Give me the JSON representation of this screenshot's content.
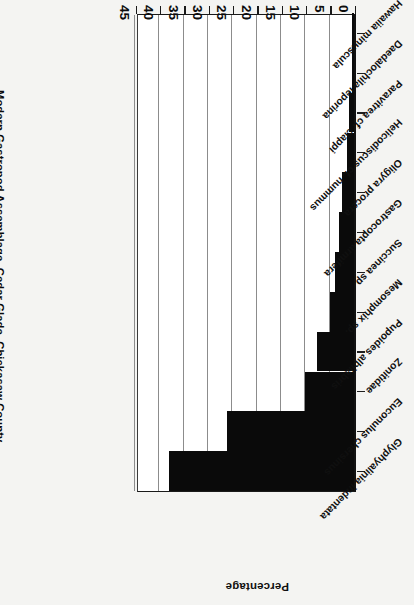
{
  "figure": {
    "title": "Modern Gastropod Assemblage, Cedar Glade, Chickasaw County",
    "axis_caption": "Percentage",
    "rotation_note": "180"
  },
  "chart_data": {
    "type": "bar",
    "orientation": "horizontal",
    "title": "Modern Gastropod Assemblage, Cedar Glade, Chickasaw County",
    "xlabel": "Percentage",
    "ylabel": "",
    "xlim": [
      0,
      45
    ],
    "grid": true,
    "legend": "none",
    "ticks": [
      "0",
      "5",
      "10",
      "15",
      "20",
      "25",
      "30",
      "35",
      "40",
      "45"
    ],
    "tick_values": [
      0,
      5,
      10,
      15,
      20,
      25,
      30,
      35,
      40,
      45
    ],
    "categories": [
      "Glyphyalinia indentata",
      "Euconulus chersinus",
      "Zonitidae",
      "Pupoides albilabris",
      "Mesomphix sp.",
      "Succinea sp.",
      "Gastrocopta armifera",
      "Oligyra procera",
      "Helicodiscus cf. nummus",
      "Paravitrea cf. clappi",
      "Daedalochila leporina",
      "Hawaiia minuscula"
    ],
    "values": [
      38,
      26,
      10,
      7.5,
      5,
      4,
      3,
      2.5,
      1.5,
      1,
      0.4,
      0.4
    ],
    "bar_color": "#0a0a0a",
    "plot_background": "#ffffff"
  }
}
